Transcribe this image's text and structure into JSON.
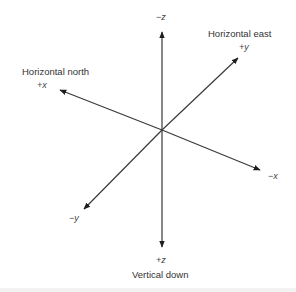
{
  "diagram": {
    "center": [
      162,
      130
    ],
    "axes": [
      {
        "id": "neg-z",
        "symbol": "−z",
        "tip": [
          162,
          30
        ]
      },
      {
        "id": "pos-z",
        "symbol": "+z",
        "tip": [
          162,
          249
        ],
        "description": "Vertical down"
      },
      {
        "id": "pos-x",
        "symbol": "+x",
        "tip": [
          58,
          89
        ],
        "description": "Horizontal north"
      },
      {
        "id": "neg-x",
        "symbol": "−x",
        "tip": [
          262,
          171
        ]
      },
      {
        "id": "pos-y",
        "symbol": "+y",
        "tip": [
          239,
          57
        ],
        "description": "Horizontal east"
      },
      {
        "id": "neg-y",
        "symbol": "−y",
        "tip": [
          83,
          210
        ]
      }
    ],
    "labels": {
      "neg_z": "−z",
      "pos_z": "+z",
      "vertical_down": "Vertical down",
      "pos_x": "+x",
      "horizontal_north": "Horizontal north",
      "neg_x": "−x",
      "pos_y": "+y",
      "horizontal_east": "Horizontal east",
      "neg_y": "−y"
    },
    "colors": {
      "line": "#3a3a3a",
      "arrowhead": "#1e1e1e",
      "text": "#333333",
      "background": "#ffffff"
    }
  }
}
